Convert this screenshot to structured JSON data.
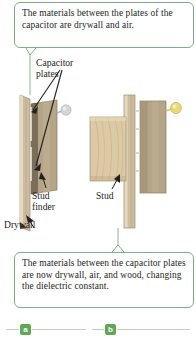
{
  "figure": {
    "callouts": [
      {
        "id": "top",
        "text": "The materials between the plates of the capacitor are drywall and air."
      },
      {
        "id": "bottom",
        "text": "The materials between the capacitor plates are now drywall, air, and wood, changing the dielectric constant."
      }
    ],
    "annotations": {
      "capacitor_plates": "Capacitor\nplates",
      "stud_finder": "Stud\nfinder",
      "drywall": "Drywall",
      "stud": "Stud"
    },
    "panels": [
      {
        "tag": "a",
        "lamp_state": "off",
        "lamp_color": "#c9cdd1"
      },
      {
        "tag": "b",
        "lamp_state": "on",
        "lamp_color": "#e8d064"
      }
    ],
    "colors": {
      "callout_border": "#7fae82",
      "tag_background": "#5fa855",
      "tag_text": "#ffffff",
      "rule": "#b9d3b3",
      "text": "#231f20",
      "drywall": "#d9cbb0",
      "device": "#b9a98a",
      "wood_stud": "#d7c6a4",
      "lamp_off": "#c9cdd1",
      "lamp_on": "#e8d064"
    }
  }
}
